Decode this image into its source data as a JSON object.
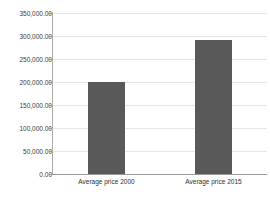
{
  "chart_data": {
    "type": "bar",
    "title": "",
    "subtitle": "",
    "xlabel": "",
    "ylabel": "",
    "categories": [
      "Average price 2000",
      "Average price 2015"
    ],
    "values": [
      200000,
      291000
    ],
    "value_labels": [
      "200,000.00",
      "291,000.00"
    ],
    "series": [
      {
        "name": "Average price",
        "values": [
          200000,
          291000
        ],
        "color": "#595959"
      }
    ],
    "ylim": [
      0,
      350000
    ],
    "ytick_step": 50000,
    "ytick_values": [
      350000,
      300000,
      250000,
      200000,
      150000,
      100000,
      50000,
      0
    ],
    "ytick_labels": [
      "350,000.00",
      "300,000.00",
      "250,000.00",
      "200,000.00",
      "150,000.00",
      "100,000.00",
      "50,000.00",
      "0.00"
    ],
    "grid": true,
    "grid_axis": "y",
    "legend": false,
    "legend_position": "none",
    "bar_color": "#595959",
    "grid_color": "#e6e6e6",
    "axis_color": "#9a9a9a",
    "background_color": "#ffffff",
    "text_color": "#3a3a3a"
  }
}
